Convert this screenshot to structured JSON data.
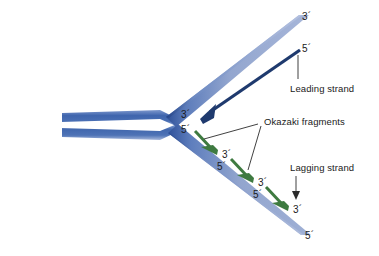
{
  "figure": {
    "background_color": "#ffffff",
    "colors": {
      "template_strand_light": "#8fa0c8",
      "template_strand_mid": "#5b78b4",
      "template_strand_dark": "#32539a",
      "parent_duplex": "#4a6cb0",
      "leading_strand_arrow": "#1f3a6e",
      "okazaki_arrow": "#3e7a40",
      "leader_line": "#2b2b2b",
      "text": "#1a1a1a"
    }
  },
  "labels": {
    "upper_template_3prime": "3´",
    "leading_5prime": "5´",
    "leading_strand_name": "Leading strand",
    "fork_upper_3prime": "3´",
    "fork_lower_5prime": "5´",
    "okazaki_name": "Okazaki fragments",
    "okazaki_1_3prime": "3´",
    "okazaki_2_5prime": "5´",
    "okazaki_2_3prime": "3´",
    "okazaki_3_5prime": "5´",
    "okazaki_3_3prime": "3´",
    "lagging_strand_name": "Lagging strand",
    "lower_template_5prime": "5´"
  },
  "strands": {
    "parent_duplex": {
      "name": "parental-dna-duplex",
      "description": "two horizontal blue bands entering from the left"
    },
    "upper_template": {
      "name": "upper-template-strand",
      "three_prime_end": "3´"
    },
    "lower_template": {
      "name": "lower-template-strand",
      "five_prime_end": "5´"
    },
    "leading_strand": {
      "name": "leading-strand",
      "direction": "5´ to 3´ continuous",
      "start": "5´",
      "end": "3´"
    },
    "okazaki_fragments": [
      {
        "start": "5´",
        "end": "3´"
      },
      {
        "start": "5´",
        "end": "3´"
      },
      {
        "start": "5´",
        "end": "3´"
      }
    ]
  }
}
